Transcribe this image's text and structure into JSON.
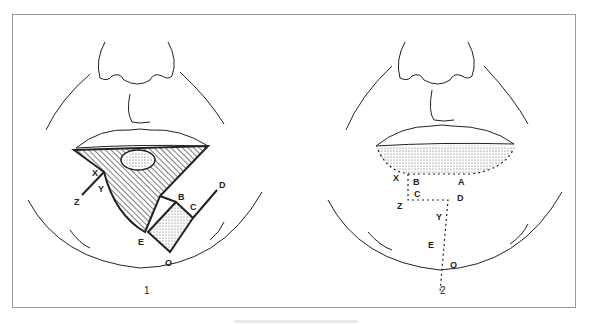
{
  "figure": {
    "panels": [
      {
        "caption": "1",
        "description": "Lower lip lesion excision plan with flap incisions",
        "labels": {
          "X": "X",
          "Y": "Y",
          "Z": "Z",
          "B": "B",
          "C": "C",
          "D": "D",
          "E": "E",
          "O": "O"
        }
      },
      {
        "caption": "2",
        "description": "Closure after flap advancement with sutures",
        "labels": {
          "X": "X",
          "B": "B",
          "A": "A",
          "C": "C",
          "Z": "Z",
          "D": "D",
          "Y": "Y",
          "E": "E",
          "O": "O"
        }
      }
    ]
  },
  "colors": {
    "line": "#222222",
    "frame": "#9a9a9a"
  }
}
